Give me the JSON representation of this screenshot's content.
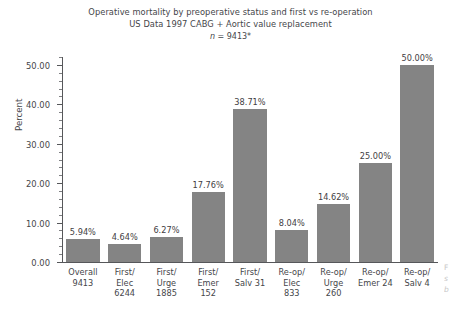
{
  "chart_data": {
    "type": "bar",
    "title": "Operative mortality by preoperative status and first vs re-operation",
    "subtitle": "US Data 1997 CABG + Aortic value replacement",
    "annotation": "n = 9413*",
    "annotation_italic": "n",
    "annotation_rest": " = 9413*",
    "xlabel": "",
    "ylabel": "Percent",
    "ylim": [
      0,
      52
    ],
    "ytick_values": [
      0,
      10,
      20,
      30,
      40,
      50
    ],
    "ytick_labels": [
      "0.00",
      "10.00",
      "20.00",
      "30.00",
      "40.00",
      "50.00"
    ],
    "minor_tick_step": 2,
    "grid": false,
    "legend": "none",
    "bar_color": "#848484",
    "axis_color": "#56575a",
    "categories": [
      "Overall\n9413",
      "First/\nElec\n6244",
      "First/\nUrge\n1885",
      "First/\nEmer\n152",
      "First/\nSalv 31",
      "Re-op/\nElec\n833",
      "Re-op/\nUrge\n260",
      "Re-op/\nEmer 24",
      "Re-op/\nSalv 4"
    ],
    "category_lines": [
      [
        "Overall",
        "9413"
      ],
      [
        "First/",
        "Elec",
        "6244"
      ],
      [
        "First/",
        "Urge",
        "1885"
      ],
      [
        "First/",
        "Emer",
        "152"
      ],
      [
        "First/",
        "Salv 31"
      ],
      [
        "Re-op/",
        "Elec",
        "833"
      ],
      [
        "Re-op/",
        "Urge",
        "260"
      ],
      [
        "Re-op/",
        "Emer 24"
      ],
      [
        "Re-op/",
        "Salv 4"
      ]
    ],
    "values": [
      5.94,
      4.64,
      6.27,
      17.76,
      38.71,
      8.04,
      14.62,
      25.0,
      50.0
    ],
    "value_labels": [
      "5.94%",
      "4.64%",
      "6.27%",
      "17.76%",
      "38.71%",
      "8.04%",
      "14.62%",
      "25.00%",
      "50.00%"
    ],
    "group_counts": [
      9413,
      6244,
      1885,
      152,
      31,
      833,
      260,
      24,
      4
    ]
  },
  "page_bleed": {
    "line1": "F",
    "line2": "s",
    "line3": "b"
  }
}
